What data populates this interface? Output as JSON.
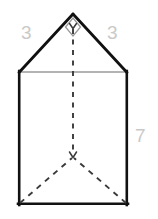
{
  "figure": {
    "name": "triangular-prism-net-diagram",
    "background_color": "#ffffff",
    "solid_edge_color": "#111111",
    "light_edge_color": "#9a9a9a",
    "dashed_edge_color": "#3a3a3a",
    "label_color": "#c9c9c9"
  },
  "labels": {
    "left_leg": "3",
    "right_leg": "3",
    "height": "7"
  },
  "geometry": {
    "apex": {
      "x": 73,
      "y": 14
    },
    "rect_left": 19,
    "rect_right": 127,
    "rect_top": 72,
    "rect_bottom": 205,
    "hidden_vertex": {
      "x": 73,
      "y": 157
    },
    "right_angle_marker": {
      "type": "diamond",
      "center": {
        "x": 73,
        "y": 27
      },
      "half_width": 7,
      "half_height": 9
    }
  },
  "markers": {
    "right_angle": "right-angle-marker",
    "apex_tick": "apex-arrow-tick",
    "vertex_tick": "hidden-vertex-arrow-tick"
  }
}
